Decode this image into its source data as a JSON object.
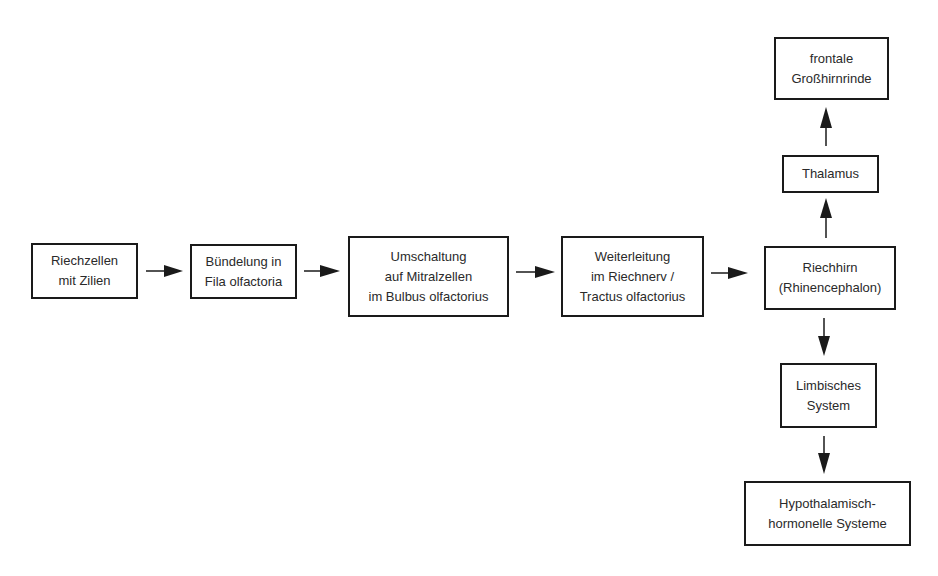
{
  "diagram": {
    "type": "flowchart",
    "topic": "Olfactory pathway",
    "nodes": {
      "riechzellen": {
        "line1": "Riechzellen",
        "line2": "mit Zilien"
      },
      "buendelung": {
        "line1": "Bündelung in",
        "line2": "Fila olfactoria"
      },
      "umschaltung": {
        "line1": "Umschaltung",
        "line2": "auf Mitralzellen",
        "line3": "im Bulbus olfactorius"
      },
      "weiterleitung": {
        "line1": "Weiterleitung",
        "line2": "im Riechnerv /",
        "line3": "Tractus olfactorius"
      },
      "riechhirn": {
        "line1": "Riechhirn",
        "line2": "(Rhinencephalon)"
      },
      "thalamus": {
        "line1": "Thalamus"
      },
      "grosshirnrinde": {
        "line1": "frontale",
        "line2": "Großhirnrinde"
      },
      "limbisch": {
        "line1": "Limbisches",
        "line2": "System"
      },
      "hypothalamisch": {
        "line1": "Hypothalamisch-",
        "line2": "hormonelle Systeme"
      }
    },
    "edges": [
      {
        "from": "riechzellen",
        "to": "buendelung"
      },
      {
        "from": "buendelung",
        "to": "umschaltung"
      },
      {
        "from": "umschaltung",
        "to": "weiterleitung"
      },
      {
        "from": "weiterleitung",
        "to": "riechhirn"
      },
      {
        "from": "riechhirn",
        "to": "thalamus"
      },
      {
        "from": "thalamus",
        "to": "grosshirnrinde"
      },
      {
        "from": "riechhirn",
        "to": "limbisch"
      },
      {
        "from": "limbisch",
        "to": "hypothalamisch"
      }
    ],
    "colors": {
      "stroke": "#1a1a1a",
      "background": "#ffffff",
      "text": "#2a2a2a"
    }
  }
}
